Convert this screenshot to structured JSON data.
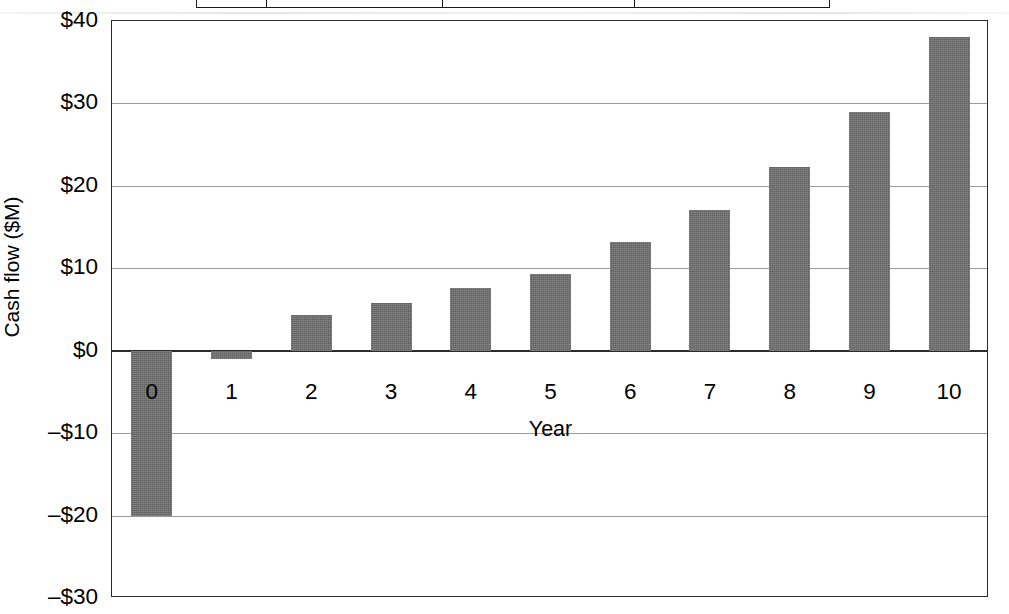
{
  "chart_data": {
    "type": "bar",
    "title": "",
    "xlabel": "Year",
    "ylabel": "Cash flow ($M)",
    "categories": [
      "0",
      "1",
      "2",
      "3",
      "4",
      "5",
      "6",
      "7",
      "8",
      "9",
      "10"
    ],
    "values": [
      -20,
      -1,
      4.3,
      5.8,
      7.6,
      9.3,
      13.2,
      17.1,
      22.3,
      29,
      38
    ],
    "series": [
      {
        "name": "Cash flow",
        "values": [
          -20,
          -1,
          4.3,
          5.8,
          7.6,
          9.3,
          13.2,
          17.1,
          22.3,
          29,
          38
        ]
      }
    ],
    "ylim": [
      -30,
      40
    ],
    "ytick_values": [
      40,
      30,
      20,
      10,
      0,
      -10,
      -20,
      -30
    ],
    "ytick_labels": [
      "$40",
      "$30",
      "$20",
      "$10",
      "$0",
      "–$10",
      "–$20",
      "–$30"
    ],
    "xtick_labels": [
      "0",
      "1",
      "2",
      "3",
      "4",
      "5",
      "6",
      "7",
      "8",
      "9",
      "10"
    ],
    "grid": true,
    "legend": false,
    "bar_color": "#6d6d6d",
    "axis_color": "#2a2a2a",
    "gridline_color": "#9a9a9a"
  },
  "top_table": {
    "visible": "partial-cropped-row",
    "cells": [
      "",
      "",
      "",
      ""
    ]
  },
  "axis_title_x": "Year",
  "axis_title_y": "Cash flow ($M)"
}
